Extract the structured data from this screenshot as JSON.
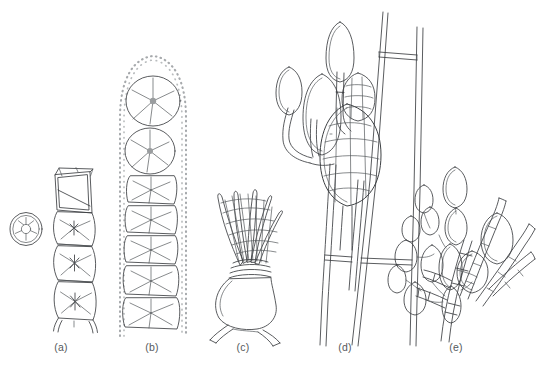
{
  "figure": {
    "type": "scientific-line-illustration",
    "background_color": "#ffffff",
    "line_color": "#3c3f42",
    "caption_color": "#55595c",
    "panel_count": 5
  },
  "panels": [
    {
      "id": "a",
      "label": "(a)",
      "description": "Unbranched filament of barrel-shaped cells with stellate chloroplasts, plus one detached single cell at left",
      "features": [
        "detached-oval-cell",
        "empty-apical-cells",
        "diagonal-septum",
        "stellate-chloroplast",
        "basal-rhizoid-projections"
      ],
      "cell_count": 6
    },
    {
      "id": "b",
      "label": "(b)",
      "description": "Filament of rounded to rectangular cells enclosed in a wide dotted mucilage sheath, each cell with a stellate chloroplast",
      "features": [
        "dotted-mucilage-sheath",
        "rounded-apical-cell",
        "stellate-chloroplast",
        "rectangular-cells"
      ],
      "cell_count": 7
    },
    {
      "id": "c",
      "label": "(c)",
      "description": "Urn-shaped basal cell bearing a spreading fan of overlapping striate plates, supported on two splayed legs",
      "features": [
        "urn-shaped-base",
        "two-splayed-legs",
        "overlapping-plates",
        "striations"
      ],
      "cell_count": 1
    },
    {
      "id": "d",
      "label": "(d)",
      "description": "Branched filament system on a broad double-walled main axis, bearing stalked stippled unilocular sporangia and one large sporangium divided into polygonal zoospore compartments",
      "features": [
        "broad-main-axis",
        "cross-walls",
        "stalked-sporangia",
        "stippled-contents",
        "polygonal-zoospore-compartments"
      ],
      "sporangia_count": 6
    },
    {
      "id": "e",
      "label": "(e)",
      "description": "Dense cluster of ovoid stippled sporangia borne on short branched filaments, intermixed with long tapering colourless hairs",
      "features": [
        "branched-basal-filament",
        "clustered-ovoid-sporangia",
        "stippled-contents",
        "tapering-hairs",
        "segmented-cells"
      ],
      "sporangia_count": 14
    }
  ],
  "captions": {
    "a": "(a)",
    "b": "(b)",
    "c": "(c)",
    "d": "(d)",
    "e": "(e)"
  }
}
